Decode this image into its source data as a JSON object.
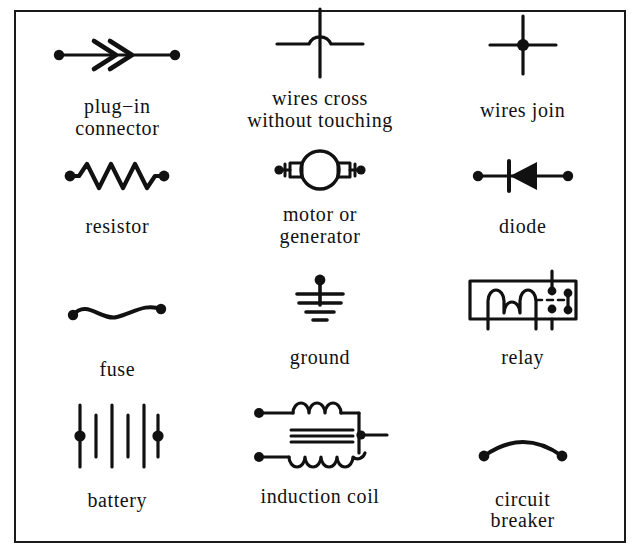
{
  "sheet": {
    "title": "electrical circuit symbols chart",
    "background_color": "#ffffff",
    "ink_color": "#111111",
    "border_color": "#1a1a1a",
    "columns": 3,
    "rows": 4
  },
  "symbols": [
    {
      "id": "plug-in-connector",
      "label": "plug−in\nconnector",
      "glyph": "double-chevron-on-line-with-end-dots",
      "row": 1,
      "col": 1
    },
    {
      "id": "wires-cross-without-touching",
      "label": "wires cross\nwithout touching",
      "glyph": "vertical-line-with-horizontal-hop",
      "row": 1,
      "col": 2
    },
    {
      "id": "wires-join",
      "label": "wires join",
      "glyph": "cross-with-center-dot",
      "row": 1,
      "col": 3
    },
    {
      "id": "resistor",
      "label": "resistor",
      "glyph": "zigzag-with-end-dots",
      "row": 2,
      "col": 1
    },
    {
      "id": "motor-or-generator",
      "label": "motor or\ngenerator",
      "glyph": "circle-with-brushes-and-end-dots",
      "row": 2,
      "col": 2
    },
    {
      "id": "diode",
      "label": "diode",
      "glyph": "triangle-with-cathode-bar-pointing-left",
      "row": 2,
      "col": 3
    },
    {
      "id": "fuse",
      "label": "fuse",
      "glyph": "s-curve-with-end-dots",
      "row": 3,
      "col": 1
    },
    {
      "id": "ground",
      "label": "ground",
      "glyph": "stem-with-four-decreasing-bars",
      "row": 3,
      "col": 2
    },
    {
      "id": "relay",
      "label": "relay",
      "glyph": "box-with-coil-and-contacts",
      "row": 3,
      "col": 3
    },
    {
      "id": "battery",
      "label": "battery",
      "glyph": "alternating-long-short-plates",
      "row": 4,
      "col": 1
    },
    {
      "id": "induction-coil",
      "label": "induction coil",
      "glyph": "primary-coil-core-secondary-coil",
      "row": 4,
      "col": 2
    },
    {
      "id": "circuit-breaker",
      "label": "circuit\nbreaker",
      "glyph": "arc-with-end-dots",
      "row": 4,
      "col": 3
    }
  ]
}
